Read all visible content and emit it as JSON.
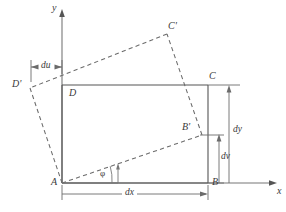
{
  "figure": {
    "type": "geometry-diagram",
    "axes": {
      "x_label": "x",
      "y_label": "y",
      "origin_point": "A"
    },
    "vertices": {
      "original": [
        {
          "name": "A",
          "x": 62,
          "y": 183
        },
        {
          "name": "B",
          "x": 208,
          "y": 183
        },
        {
          "name": "C",
          "x": 208,
          "y": 85
        },
        {
          "name": "D",
          "x": 62,
          "y": 85
        }
      ],
      "deformed": [
        {
          "name": "A",
          "x": 62,
          "y": 183
        },
        {
          "name": "B'",
          "x": 202,
          "y": 135
        },
        {
          "name": "C'",
          "x": 167,
          "y": 34
        },
        {
          "name": "D'",
          "x": 30,
          "y": 88
        }
      ]
    },
    "point_labels": [
      {
        "text": "A",
        "x": 51,
        "y": 178
      },
      {
        "text": "B",
        "x": 212,
        "y": 178
      },
      {
        "text": "C",
        "x": 211,
        "y": 72
      },
      {
        "text": "D",
        "x": 69,
        "y": 88
      },
      {
        "text": "B'",
        "x": 183,
        "y": 123
      },
      {
        "text": "C'",
        "x": 170,
        "y": 22
      },
      {
        "text": "D'",
        "x": 13,
        "y": 80
      }
    ],
    "dimensions": [
      {
        "name": "dx",
        "text": "dx",
        "label_x": 128,
        "label_y": 188,
        "orientation": "horizontal"
      },
      {
        "name": "dy",
        "text": "dy",
        "label_x": 234,
        "label_y": 130,
        "orientation": "vertical"
      },
      {
        "name": "dv",
        "text": "dv",
        "label_x": 224,
        "label_y": 157,
        "orientation": "vertical"
      },
      {
        "name": "du",
        "text": "du",
        "label_x": 39,
        "label_y": 61,
        "orientation": "horizontal"
      }
    ],
    "angle": {
      "symbol": "φ",
      "label_x": 102,
      "label_y": 170,
      "vertex": "A"
    },
    "colors": {
      "stroke": "#555555",
      "dashed_stroke": "#6b6b6b",
      "text": "#3a3a3a",
      "background": "#ffffff"
    }
  }
}
